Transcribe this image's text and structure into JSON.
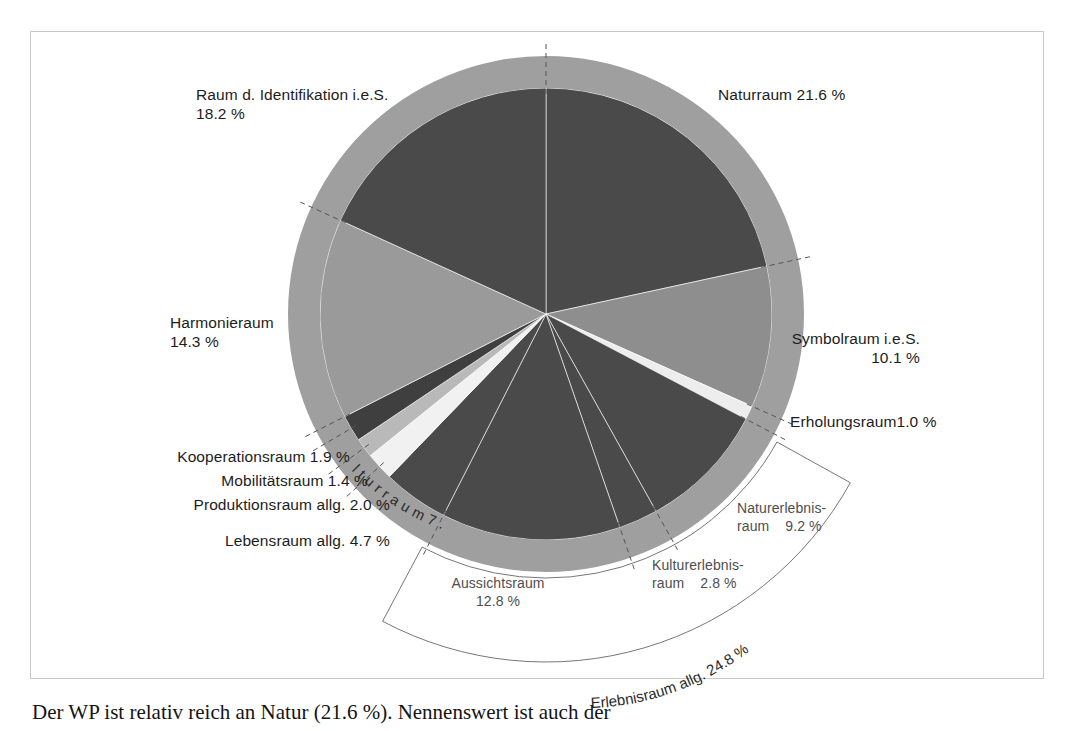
{
  "figure": {
    "title": "",
    "border_color": "#c9c9c9",
    "background": "#ffffff"
  },
  "chart_data": {
    "type": "pie",
    "title": "",
    "xlabel": "",
    "ylabel": "",
    "legend_position": "callout-labels",
    "grid": false,
    "units": "%",
    "center": {
      "x": 546,
      "y": 314
    },
    "inner_radius": 226,
    "outer_ring_radius": 258,
    "start_angle_deg": -90,
    "direction": "clockwise",
    "categories": [
      "Naturraum",
      "Symbolraum i.e.S.",
      "Erholungsraum",
      "Naturerlebnisraum",
      "Kulturerlebnisraum",
      "Aussichtsraum",
      "Lebensraum allg.",
      "Produktionsraum allg.",
      "Mobilitätsraum",
      "Kooperationsraum",
      "Harmonieraum",
      "Raum d. Identifikation i.e.S."
    ],
    "values": [
      21.6,
      10.1,
      1.0,
      9.2,
      2.8,
      12.8,
      4.7,
      2.0,
      1.4,
      1.9,
      14.3,
      18.2
    ],
    "colors": [
      "#4a4a4a",
      "#8e8e8e",
      "#ededed",
      "#4a4a4a",
      "#4a4a4a",
      "#4a4a4a",
      "#4a4a4a",
      "#f1f1f1",
      "#b9b9b9",
      "#3f3f3f",
      "#9a9a9a",
      "#4a4a4a"
    ],
    "slice_extra": {
      "raum_d_identifikation_color": "#d9d9d9",
      "harmonieraum_color": "#4a4a4a",
      "kooperationsraum_color": "#9a9a9a",
      "mobilitaetsraum_color": "#3f3f3f",
      "produktionsraum_color": "#b9b9b9",
      "lebensraum_color": "#f4f4f4"
    },
    "ring_color": "#9f9f9f",
    "groups": [
      {
        "label": "Erlebnisraum allg.",
        "value": 24.8,
        "members": [
          "Aussichtsraum",
          "Kulturerlebnisraum",
          "Naturerlebnisraum"
        ]
      },
      {
        "label": "Kulturraum",
        "value": 7.8,
        "members": [
          "Lebensraum allg.",
          "Produktionsraum allg.",
          "Mobilitätsraum",
          "Kooperationsraum"
        ]
      }
    ]
  },
  "labels": {
    "naturraum": "Naturraum 21.6 %",
    "symbolraum_l1": "Symbolraum i.e.S.",
    "symbolraum_l2": "10.1 %",
    "erholungsraum": "Erholungsraum1.0 %",
    "naturerlebnisraum_l1": "Naturerlebnis-",
    "naturerlebnisraum_l2": "raum    9.2 %",
    "kulturerlebnisraum_l1": "Kulturerlebnis-",
    "kulturerlebnisraum_l2": "raum    2.8 %",
    "aussichtsraum_l1": "Aussichtsraum",
    "aussichtsraum_l2": "12.8 %",
    "lebensraum": "Lebensraum allg. 4.7 %",
    "produktionsraum": "Produktionsraum allg. 2.0 %",
    "mobilitaetsraum": "Mobilitätsraum 1.4 %",
    "kooperationsraum": "Kooperationsraum 1.9 %",
    "harmonieraum_l1": "Harmonieraum",
    "harmonieraum_l2": "14.3 %",
    "identifikation_l1": "Raum d. Identifikation i.e.S.",
    "identifikation_l2": "18.2 %",
    "ring_kulturraum": "K u l t u r r a u m   7 . 8   %",
    "bracket_erlebnisraum": "Erlebnisraum allg. 24.8 %"
  },
  "body_text": {
    "paragraph": "Der WP ist relativ reich an Natur (21.6 %). Nennenswert ist auch der"
  }
}
